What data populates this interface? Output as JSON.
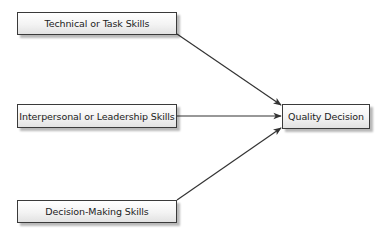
{
  "diagram": {
    "inputs": [
      {
        "label": "Technical or Task Skills"
      },
      {
        "label": "Interpersonal or Leadership Skills"
      },
      {
        "label": "Decision-Making Skills"
      }
    ],
    "output": {
      "label": "Quality Decision"
    },
    "colors": {
      "border": "#3a3a3a",
      "arrow": "#333333",
      "text": "#222222"
    }
  }
}
